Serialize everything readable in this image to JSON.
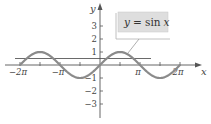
{
  "chart_data": {
    "type": "line",
    "title": "",
    "xlabel": "x",
    "ylabel": "y",
    "xlim": [
      -6.283,
      6.283
    ],
    "ylim": [
      -3,
      3
    ],
    "grid": false,
    "x_ticks": [
      {
        "value": -6.2832,
        "label": "−2π"
      },
      {
        "value": -4.7124,
        "label": ""
      },
      {
        "value": -3.1416,
        "label": "−π"
      },
      {
        "value": -1.5708,
        "label": ""
      },
      {
        "value": 1.5708,
        "label": ""
      },
      {
        "value": 3.1416,
        "label": "π"
      },
      {
        "value": 4.7124,
        "label": ""
      },
      {
        "value": 6.2832,
        "label": "2π"
      }
    ],
    "y_ticks": [
      {
        "value": 3,
        "label": "3"
      },
      {
        "value": 2,
        "label": "2"
      },
      {
        "value": 1,
        "label": "1"
      },
      {
        "value": -1,
        "label": "−1"
      },
      {
        "value": -2,
        "label": "−2"
      },
      {
        "value": -3,
        "label": "−3"
      }
    ],
    "series": [
      {
        "name": "y = sin x",
        "function": "sin(x)",
        "x": [
          -6.2832,
          -4.7124,
          -3.1416,
          -1.5708,
          0,
          1.5708,
          3.1416,
          4.7124,
          6.2832
        ],
        "y": [
          0,
          1,
          0,
          -1,
          0,
          1,
          0,
          -1,
          0
        ],
        "color": "#8a8a8a"
      },
      {
        "name": "horizontal line",
        "function": "y = 0.5",
        "x": [
          -6.5,
          3.7
        ],
        "y": [
          0.5,
          0.5
        ],
        "color": "#666666"
      }
    ],
    "annotations": [
      {
        "text": "y = sin x",
        "points_to": [
          1.2,
          0.95
        ]
      }
    ],
    "legend": {
      "position": "callout-box top-right",
      "entries": [
        "y = sin x"
      ]
    }
  },
  "legend": {
    "label_y": "y",
    "label_eq": "= sin",
    "label_x": "x"
  },
  "axes": {
    "x_label": "x",
    "y_label": "y"
  },
  "colors": {
    "axis": "#555555",
    "curve": "#8a8a8a",
    "hline": "#6a6a6a",
    "legend_fill": "#dedede",
    "legend_frame": "#9a9a9a"
  }
}
